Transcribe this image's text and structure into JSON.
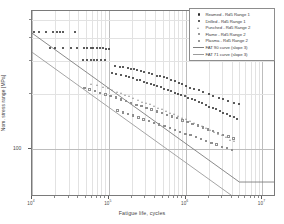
{
  "chart_data": {
    "type": "scatter",
    "title": "",
    "xlabel": "Fatigue life, cycles",
    "ylabel": "Nom. stress range [MPa]",
    "xscale": "log",
    "yscale": "log",
    "xlim": [
      10000,
      15000000
    ],
    "ylim": [
      55,
      560
    ],
    "xticks": [
      10000,
      100000,
      1000000,
      10000000
    ],
    "xticklabels": [
      "10⁴",
      "10⁵",
      "10⁶",
      "10⁷"
    ],
    "yticks": [
      100
    ],
    "yticklabels": [
      "100"
    ],
    "grid": true,
    "legend_position": "top-right",
    "series": [
      {
        "name": "Reamed  - Rd5 Range 1",
        "marker": "filled-dot",
        "color": "#262626",
        "points": [
          [
            10500,
            430
          ],
          [
            12500,
            430
          ],
          [
            15000,
            430
          ],
          [
            19000,
            430
          ],
          [
            21000,
            430
          ],
          [
            23000,
            430
          ],
          [
            25000,
            430
          ],
          [
            36000,
            430
          ],
          [
            17000,
            355
          ],
          [
            20000,
            355
          ],
          [
            25000,
            355
          ],
          [
            32000,
            355
          ],
          [
            39000,
            355
          ],
          [
            47000,
            355
          ],
          [
            52000,
            355
          ],
          [
            58000,
            355
          ],
          [
            63000,
            355
          ],
          [
            70000,
            355
          ],
          [
            77000,
            355
          ],
          [
            85000,
            355
          ],
          [
            93000,
            350
          ],
          [
            100000,
            350
          ],
          [
            46000,
            305
          ],
          [
            52000,
            305
          ],
          [
            58000,
            305
          ],
          [
            64000,
            305
          ],
          [
            70000,
            305
          ],
          [
            78000,
            305
          ],
          [
            88000,
            303
          ],
          [
            120000,
            282
          ],
          [
            140000,
            280
          ],
          [
            155000,
            278
          ],
          [
            175000,
            276
          ],
          [
            195000,
            272
          ],
          [
            210000,
            270
          ],
          [
            230000,
            268
          ],
          [
            260000,
            265
          ],
          [
            290000,
            262
          ],
          [
            330000,
            258
          ],
          [
            370000,
            256
          ],
          [
            420000,
            250
          ],
          [
            460000,
            248
          ],
          [
            520000,
            245
          ],
          [
            580000,
            242
          ],
          [
            650000,
            238
          ],
          [
            720000,
            234
          ],
          [
            820000,
            228
          ],
          [
            900000,
            224
          ],
          [
            1000000,
            220
          ],
          [
            1150000,
            215
          ],
          [
            1300000,
            212
          ],
          [
            1500000,
            208
          ],
          [
            1700000,
            204
          ],
          [
            2000000,
            198
          ],
          [
            2300000,
            195
          ],
          [
            2700000,
            190
          ],
          [
            3100000,
            186
          ],
          [
            3600000,
            182
          ],
          [
            4200000,
            178
          ],
          [
            5000000,
            175
          ]
        ]
      },
      {
        "name": "Drilled   - Rd5 Range 1",
        "marker": "filled-dot",
        "color": "#262626",
        "points": [
          [
            110000,
            258
          ],
          [
            125000,
            255
          ],
          [
            145000,
            252
          ],
          [
            165000,
            248
          ],
          [
            185000,
            246
          ],
          [
            205000,
            242
          ],
          [
            230000,
            238
          ],
          [
            255000,
            236
          ],
          [
            285000,
            232
          ],
          [
            315000,
            228
          ],
          [
            350000,
            226
          ],
          [
            390000,
            222
          ],
          [
            430000,
            220
          ],
          [
            480000,
            216
          ],
          [
            530000,
            212
          ],
          [
            590000,
            210
          ],
          [
            650000,
            206
          ],
          [
            720000,
            202
          ],
          [
            800000,
            200
          ],
          [
            880000,
            196
          ],
          [
            970000,
            193
          ],
          [
            1080000,
            190
          ],
          [
            1200000,
            187
          ],
          [
            1330000,
            184
          ],
          [
            1480000,
            180
          ],
          [
            1650000,
            177
          ],
          [
            1830000,
            174
          ],
          [
            2030000,
            170
          ],
          [
            2260000,
            167
          ],
          [
            2500000,
            164
          ],
          [
            2800000,
            160
          ],
          [
            3100000,
            157
          ],
          [
            3450000,
            154
          ],
          [
            3800000,
            152
          ],
          [
            4200000,
            149
          ],
          [
            4700000,
            146
          ]
        ]
      },
      {
        "name": "Punched - Rd5 Range 2",
        "marker": "open-triangle",
        "color": "#8f8f8f",
        "points": [
          [
            60000,
            225
          ],
          [
            72000,
            220
          ],
          [
            84000,
            216
          ],
          [
            98000,
            212
          ],
          [
            112000,
            208
          ],
          [
            128000,
            204
          ],
          [
            145000,
            200
          ],
          [
            165000,
            196
          ],
          [
            188000,
            192
          ],
          [
            212000,
            188
          ],
          [
            240000,
            184
          ],
          [
            272000,
            180
          ],
          [
            308000,
            177
          ],
          [
            348000,
            174
          ],
          [
            394000,
            170
          ],
          [
            445000,
            167
          ],
          [
            500000,
            164
          ],
          [
            565000,
            160
          ],
          [
            640000,
            157
          ],
          [
            720000,
            154
          ],
          [
            810000,
            150
          ],
          [
            915000,
            147
          ],
          [
            1030000,
            144
          ],
          [
            1160000,
            141
          ],
          [
            1310000,
            138
          ],
          [
            1480000,
            135
          ],
          [
            1670000,
            132
          ],
          [
            1880000,
            129
          ],
          [
            2120000,
            126
          ],
          [
            2390000,
            123
          ],
          [
            2700000,
            120
          ],
          [
            3040000,
            118
          ],
          [
            3430000,
            115
          ],
          [
            3870000,
            112
          ],
          [
            4360000,
            110
          ]
        ]
      },
      {
        "name": "Flame   - Rd5 Range 2",
        "marker": "open-square",
        "color": "#8f8f8f",
        "points": [
          [
            48000,
            215
          ],
          [
            56000,
            210
          ],
          [
            66000,
            206
          ],
          [
            77000,
            202
          ],
          [
            90000,
            198
          ],
          [
            105000,
            194
          ],
          [
            123000,
            190
          ],
          [
            143000,
            186
          ],
          [
            167000,
            182
          ],
          [
            195000,
            178
          ],
          [
            228000,
            174
          ],
          [
            265000,
            171
          ],
          [
            310000,
            167
          ],
          [
            360000,
            164
          ],
          [
            420000,
            160
          ],
          [
            490000,
            157
          ],
          [
            570000,
            153
          ],
          [
            665000,
            150
          ],
          [
            775000,
            147
          ],
          [
            905000,
            143
          ],
          [
            1055000,
            140
          ],
          [
            1230000,
            137
          ],
          [
            1435000,
            134
          ],
          [
            1675000,
            131
          ],
          [
            1950000,
            128
          ],
          [
            2275000,
            125
          ],
          [
            2650000,
            122
          ],
          [
            3090000,
            119
          ],
          [
            3600000,
            117
          ],
          [
            4200000,
            114
          ]
        ]
      },
      {
        "name": "Plasma  - Rd5 Range 2",
        "marker": "open-square",
        "color": "#8f8f8f",
        "points": [
          [
            130000,
            162
          ],
          [
            152000,
            158
          ],
          [
            178000,
            155
          ],
          [
            208000,
            152
          ],
          [
            243000,
            148
          ],
          [
            284000,
            145
          ],
          [
            332000,
            142
          ],
          [
            388000,
            139
          ],
          [
            453000,
            136
          ],
          [
            530000,
            133
          ],
          [
            620000,
            130
          ],
          [
            725000,
            127
          ],
          [
            847000,
            124
          ],
          [
            990000,
            121
          ],
          [
            1157000,
            119
          ],
          [
            1353000,
            116
          ],
          [
            1581000,
            113
          ],
          [
            1848000,
            111
          ],
          [
            2160000,
            108
          ],
          [
            2525000,
            106
          ],
          [
            2952000,
            103
          ],
          [
            3450000,
            101
          ],
          [
            4032000,
            99
          ]
        ]
      }
    ],
    "curves": [
      {
        "name": "FAT 90 curve (slope 3)",
        "color": "#7d7d7d",
        "slope": 3,
        "fat": 90,
        "knee_cycles": 5000000,
        "knee_stress": 66.3,
        "start_cycles": 10000,
        "start_stress": 425
      },
      {
        "name": "FAT 71 curve (slope 3)",
        "color": "#9b9b9b",
        "slope": 3,
        "fat": 71,
        "knee_cycles": 5000000,
        "knee_stress": 52.3,
        "start_cycles": 10000,
        "start_stress": 335
      }
    ]
  },
  "legend": {
    "items": [
      {
        "label": "Reamed  - Rd5 Range 1",
        "symbol": "filled-dot"
      },
      {
        "label": "Drilled   - Rd5 Range 1",
        "symbol": "filled-dot"
      },
      {
        "label": "Punched - Rd5 Range 2",
        "symbol": "open-triangle"
      },
      {
        "label": "Flame   - Rd5 Range 2",
        "symbol": "open-square"
      },
      {
        "label": "Plasma  - Rd5 Range 2",
        "symbol": "open-square"
      },
      {
        "label": "FAT 90 curve (slope 3)",
        "symbol": "line-dark"
      },
      {
        "label": "FAT 71 curve (slope 3)",
        "symbol": "line-light"
      }
    ]
  },
  "axes": {
    "x_title": "Fatigue life, cycles",
    "y_title": "Nom. stress range [MPa]",
    "y_tick_100": "100",
    "x_tick_labels": [
      "10",
      "10",
      "10",
      "10"
    ],
    "x_tick_exponents": [
      "4",
      "5",
      "6",
      "7"
    ]
  }
}
